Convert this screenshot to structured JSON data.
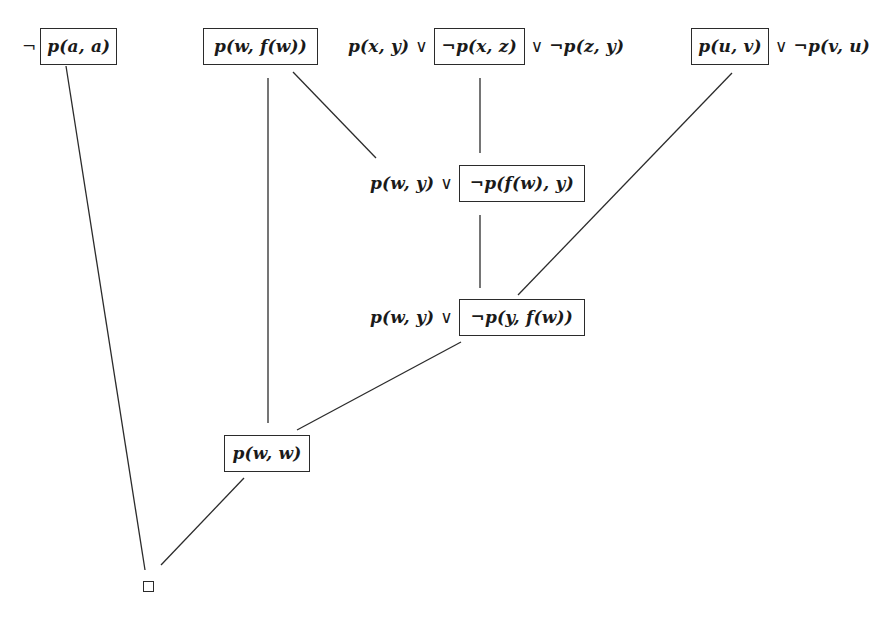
{
  "diagram": {
    "type": "resolution-refutation-tree",
    "nodes": {
      "n1": {
        "prefix": "¬",
        "boxed": "p(a, a)"
      },
      "n2": {
        "boxed": "p(w, f(w))"
      },
      "n3": {
        "before": "p(x, y)",
        "or1": "∨",
        "boxed": "¬p(x, z)",
        "or2": "∨",
        "after": "¬p(z, y)"
      },
      "n4": {
        "boxed": "p(u, v)",
        "or1": "∨",
        "after": "¬p(v, u)"
      },
      "n5": {
        "before": "p(w, y)",
        "or1": "∨",
        "boxed": "¬p(f(w), y)"
      },
      "n6": {
        "before": "p(w, y)",
        "or1": "∨",
        "boxed": "¬p(y, f(w))"
      },
      "n7": {
        "boxed": "p(w, w)"
      },
      "n8": {
        "label": "□",
        "meaning": "empty clause"
      }
    },
    "edges": [
      {
        "from": "n2",
        "to": "n5",
        "x1": 293,
        "y1": 72,
        "x2": 376,
        "y2": 158
      },
      {
        "from": "n3",
        "to": "n5",
        "x1": 480,
        "y1": 78,
        "x2": 480,
        "y2": 153
      },
      {
        "from": "n5",
        "to": "n6",
        "x1": 480,
        "y1": 215,
        "x2": 480,
        "y2": 288
      },
      {
        "from": "n4",
        "to": "n6",
        "x1": 732,
        "y1": 73,
        "x2": 518,
        "y2": 295
      },
      {
        "from": "n2",
        "to": "n7",
        "x1": 268,
        "y1": 78,
        "x2": 268,
        "y2": 423
      },
      {
        "from": "n6",
        "to": "n7",
        "x1": 461,
        "y1": 342,
        "x2": 297,
        "y2": 430
      },
      {
        "from": "n1",
        "to": "n8",
        "x1": 66,
        "y1": 66,
        "x2": 145,
        "y2": 570
      },
      {
        "from": "n7",
        "to": "n8",
        "x1": 244,
        "y1": 478,
        "x2": 161,
        "y2": 565
      }
    ]
  }
}
